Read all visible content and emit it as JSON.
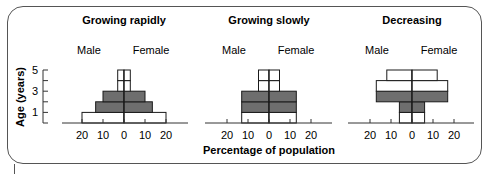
{
  "chart_data": [
    {
      "type": "bar",
      "subtype": "population-pyramid",
      "title": "Growing rapidly",
      "categories": [
        "0-1",
        "1-2",
        "2-3",
        "3-4",
        "4-5"
      ],
      "series": [
        {
          "name": "Male",
          "values": [
            20,
            13.5,
            10,
            3,
            3
          ]
        },
        {
          "name": "Female",
          "values": [
            20,
            13.5,
            10,
            3,
            3
          ]
        }
      ],
      "shading": [
        "light",
        "dark",
        "dark",
        "light",
        "light"
      ],
      "xlabel": "Percentage of population",
      "ylabel": "Age (years)",
      "xticks": [
        20,
        10,
        0,
        10,
        20
      ],
      "yticks": [
        1,
        3,
        5
      ],
      "xlim": [
        -25,
        25
      ],
      "ylim": [
        0,
        5
      ]
    },
    {
      "type": "bar",
      "subtype": "population-pyramid",
      "title": "Growing slowly",
      "categories": [
        "0-1",
        "1-2",
        "2-3",
        "3-4",
        "4-5"
      ],
      "series": [
        {
          "name": "Male",
          "values": [
            13,
            13,
            13,
            5,
            5
          ]
        },
        {
          "name": "Female",
          "values": [
            13,
            13,
            13,
            5,
            5
          ]
        }
      ],
      "shading": [
        "light",
        "dark",
        "dark",
        "light",
        "light"
      ],
      "xlabel": "Percentage of population",
      "ylabel": "Age (years)",
      "xticks": [
        20,
        10,
        0,
        10,
        20
      ],
      "xlim": [
        -25,
        25
      ],
      "ylim": [
        0,
        5
      ]
    },
    {
      "type": "bar",
      "subtype": "population-pyramid",
      "title": "Decreasing",
      "categories": [
        "0-1",
        "1-2",
        "2-3",
        "3-4",
        "4-5"
      ],
      "series": [
        {
          "name": "Male",
          "values": [
            6,
            6,
            17,
            17,
            12
          ]
        },
        {
          "name": "Female",
          "values": [
            6,
            6,
            17,
            17,
            12
          ]
        }
      ],
      "shading": [
        "light",
        "dark",
        "dark",
        "light",
        "light"
      ],
      "xlabel": "Percentage of population",
      "ylabel": "Age (years)",
      "xticks": [
        20,
        10,
        0,
        10,
        20
      ],
      "xlim": [
        -25,
        25
      ],
      "ylim": [
        0,
        5
      ]
    }
  ],
  "panels": [
    {
      "title": "Growing rapidly",
      "male": "Male",
      "female": "Female",
      "center": 124
    },
    {
      "title": "Growing slowly",
      "male": "Male",
      "female": "Female",
      "center": 269
    },
    {
      "title": "Decreasing",
      "male": "Male",
      "female": "Female",
      "center": 412
    }
  ],
  "axis": {
    "y_title": "Age (years)",
    "y_ticks": [
      "5",
      "3",
      "1"
    ],
    "x_title": "Percentage of population",
    "x_ticks": [
      "20",
      "10",
      "0",
      "10",
      "20"
    ]
  },
  "colors": {
    "dark_fill": "#6e6e6e",
    "light_fill": "#ffffff",
    "stroke": "#1a1a1a"
  }
}
